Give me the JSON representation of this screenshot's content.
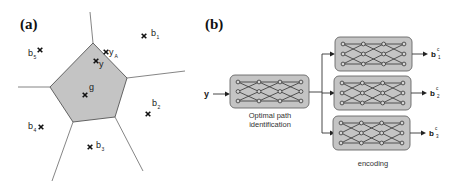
{
  "panel_a": {
    "label": "(a)",
    "points": [
      {
        "id": "b1",
        "name": "b",
        "sub": "1"
      },
      {
        "id": "b2",
        "name": "b",
        "sub": "2"
      },
      {
        "id": "b3",
        "name": "b",
        "sub": "3"
      },
      {
        "id": "b4",
        "name": "b",
        "sub": "4"
      },
      {
        "id": "b5",
        "name": "b",
        "sub": "5"
      },
      {
        "id": "g",
        "name": "g",
        "sub": ""
      },
      {
        "id": "y",
        "name": "y",
        "sub": ""
      },
      {
        "id": "yA",
        "name": "y",
        "sub": "A"
      }
    ],
    "region_fill": "#c4c4c4"
  },
  "panel_b": {
    "label": "(b)",
    "input_label": "y",
    "left_block_caption_line1": "Optimal path",
    "left_block_caption_line2": "identification",
    "right_blocks_caption": "encoding",
    "outputs": [
      {
        "name": "b",
        "sup": "c",
        "sub": "1"
      },
      {
        "name": "b",
        "sup": "c",
        "sub": "2"
      },
      {
        "name": "b",
        "sup": "c",
        "sub": "3"
      }
    ],
    "trellis": {
      "rows": 3,
      "columns": 4
    }
  }
}
